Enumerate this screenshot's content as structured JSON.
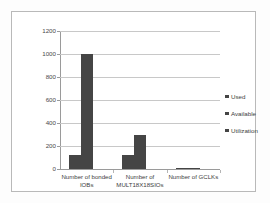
{
  "chart_data": {
    "type": "bar",
    "title": "",
    "xlabel": "",
    "ylabel": "",
    "ylim": [
      0,
      1200
    ],
    "yticks": [
      0,
      200,
      400,
      600,
      800,
      1000,
      1200
    ],
    "ytick_labels": [
      "0",
      "200",
      "400",
      "600",
      "800",
      "1000",
      "1200"
    ],
    "grid": true,
    "legend_position": "right",
    "categories": [
      "Number of bonded\nIOBs",
      "Number of\nMULT18X18SIOs",
      "Number of GCLKs"
    ],
    "series": [
      {
        "name": "Used",
        "values": [
          120,
          120,
          8
        ]
      },
      {
        "name": "Available",
        "values": [
          1000,
          300,
          8
        ]
      },
      {
        "name": "Utilization",
        "values": [
          12,
          40,
          100
        ]
      }
    ],
    "bar_color": "#454545",
    "gridline_color": "#c8c8c8",
    "axis_color": "#9a9a9a",
    "plot_background": "#ffffff"
  },
  "legend": {
    "items": [
      {
        "label": "Used"
      },
      {
        "label": "Available"
      },
      {
        "label": "Utilization"
      }
    ]
  }
}
